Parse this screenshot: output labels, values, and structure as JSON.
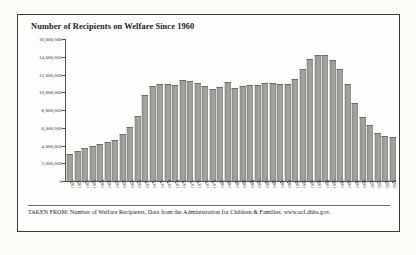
{
  "figure": {
    "title": "Number of Recipients on Welfare Since 1960",
    "caption": "TAKEN FROM: Number of Welfare Recipients. Data from the Administration for Children & Families. www.acf.dhhs.gov."
  },
  "chart_data": {
    "type": "bar",
    "title": "Number of Recipients on Welfare Since 1960",
    "xlabel": "",
    "ylabel": "",
    "ylim": [
      0,
      16000000
    ],
    "ytick_labels": [
      "16,000,000",
      "14,000,000",
      "12,000,000",
      "10,000,000",
      "8,000,000",
      "6,000,000",
      "4,000,000",
      "2,000,000",
      "0"
    ],
    "ytick_values": [
      16000000,
      14000000,
      12000000,
      10000000,
      8000000,
      6000000,
      4000000,
      2000000,
      0
    ],
    "grid": false,
    "legend": "none",
    "bar_color": "#9a9a97",
    "categories": [
      "1960",
      "1961",
      "1962",
      "1963",
      "1964",
      "1965",
      "1966",
      "1967",
      "1968",
      "1969",
      "1970",
      "1971",
      "1972",
      "1973",
      "1974",
      "1975",
      "1976",
      "1977",
      "1978",
      "1979",
      "1980",
      "1981",
      "1982",
      "1983",
      "1984",
      "1985",
      "1986",
      "1987",
      "1988",
      "1989",
      "1990",
      "1991",
      "1992",
      "1993",
      "1994",
      "1995",
      "1996",
      "1997",
      "1998",
      "1999",
      "2000",
      "2001",
      "2002",
      "2003"
    ],
    "values": [
      3005000,
      3354000,
      3676000,
      3930000,
      4219000,
      4396000,
      4666000,
      5309000,
      6086000,
      7313000,
      9659000,
      10651000,
      10947000,
      10949000,
      10864000,
      11346000,
      11304000,
      11050000,
      10672000,
      10318000,
      10597000,
      11160000,
      10431000,
      10659000,
      10866000,
      10813000,
      11038000,
      11065000,
      10920000,
      10935000,
      11460000,
      12595000,
      13773000,
      14143000,
      14226000,
      13652000,
      12649000,
      10936000,
      8770000,
      7188000,
      6277000,
      5359000,
      5069000,
      4929000
    ]
  }
}
